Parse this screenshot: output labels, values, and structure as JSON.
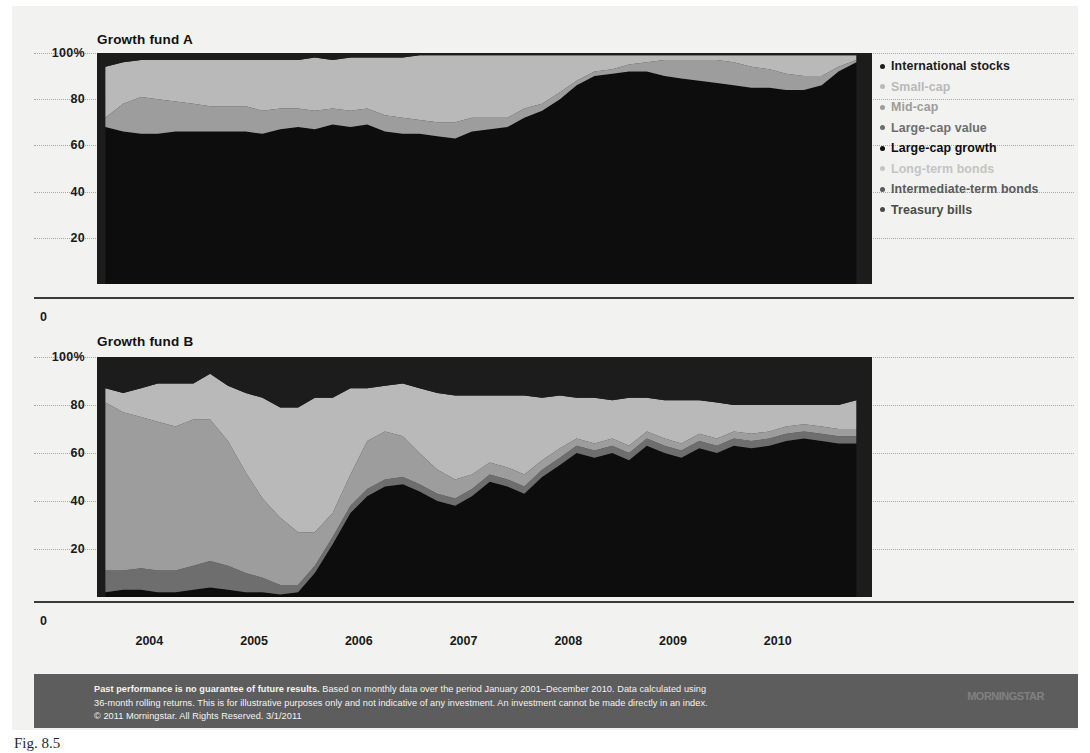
{
  "figure": {
    "caption": "Fig. 8.5",
    "background": "#f2f2f0"
  },
  "panels": [
    {
      "id": "A",
      "title": "Growth fund A"
    },
    {
      "id": "B",
      "title": "Growth fund B"
    }
  ],
  "yaxis": {
    "ticks": [
      "100%",
      "80",
      "60",
      "40",
      "20"
    ],
    "zero_label": "0",
    "values": [
      100,
      80,
      60,
      40,
      20,
      0
    ],
    "min": 0,
    "max": 100
  },
  "xaxis": {
    "ticks": [
      "2004",
      "2005",
      "2006",
      "2007",
      "2008",
      "2009",
      "2010"
    ],
    "values": [
      2004,
      2005,
      2006,
      2007,
      2008,
      2009,
      2010
    ]
  },
  "legend": {
    "position": "right",
    "items": [
      {
        "label": "International stocks",
        "color": "#1c1c1c"
      },
      {
        "label": "Small-cap",
        "color": "#b9b9b9"
      },
      {
        "label": "Mid-cap",
        "color": "#9d9d9d"
      },
      {
        "label": "Large-cap value",
        "color": "#6e6e6e"
      },
      {
        "label": "Large-cap growth",
        "color": "#0d0d0d"
      },
      {
        "label": "Long-term bonds",
        "color": "#c4c4c4"
      },
      {
        "label": "Intermediate-term bonds",
        "color": "#5a5a5a"
      },
      {
        "label": "Treasury bills",
        "color": "#4a4a4a"
      }
    ]
  },
  "footer": {
    "lead": "Past performance is no guarantee of future results.",
    "line1_rest": " Based on monthly data over the period January 2001–December 2010. Data calculated using",
    "line2": "36-month rolling returns. This is for illustrative purposes only and not indicative of any investment. An investment cannot be made directly in an index.",
    "line3": "© 2011 Morningstar. All Rights Reserved. 3/1/2011",
    "brand": "MORNINGSTAR",
    "background": "#5d5d5d",
    "text_color": "#f4f4f4"
  },
  "chart_data": {
    "type": "area",
    "xlabel": "",
    "ylabel": "",
    "ylim": [
      0,
      100
    ],
    "xlim": [
      2003.5,
      2010.9
    ],
    "grid": true,
    "stacked": true,
    "legend_position": "right",
    "charts": [
      {
        "name": "Growth fund A",
        "x": [
          2003.58,
          2003.75,
          2003.92,
          2004.08,
          2004.25,
          2004.42,
          2004.58,
          2004.75,
          2004.92,
          2005.08,
          2005.25,
          2005.42,
          2005.58,
          2005.75,
          2005.92,
          2006.08,
          2006.25,
          2006.42,
          2006.58,
          2006.75,
          2006.92,
          2007.08,
          2007.25,
          2007.42,
          2007.58,
          2007.75,
          2007.92,
          2008.08,
          2008.25,
          2008.42,
          2008.58,
          2008.75,
          2008.92,
          2009.08,
          2009.25,
          2009.42,
          2009.58,
          2009.75,
          2009.92,
          2010.08,
          2010.25,
          2010.42,
          2010.58,
          2010.75
        ],
        "series": [
          {
            "name": "Large-cap growth",
            "color": "#0d0d0d",
            "values": [
              68,
              66,
              65,
              65,
              66,
              66,
              66,
              66,
              66,
              65,
              67,
              68,
              67,
              69,
              68,
              69,
              66,
              65,
              65,
              64,
              63,
              66,
              67,
              68,
              72,
              75,
              80,
              86,
              90,
              91,
              92,
              92,
              90,
              89,
              88,
              87,
              86,
              85,
              85,
              84,
              84,
              86,
              92,
              96
            ]
          },
          {
            "name": "Mid-cap",
            "color": "#9d9d9d",
            "values": [
              4,
              12,
              16,
              15,
              13,
              12,
              11,
              11,
              11,
              10,
              9,
              8,
              8,
              7,
              7,
              7,
              7,
              7,
              6,
              6,
              7,
              6,
              5,
              4,
              4,
              3,
              3,
              2,
              2,
              2,
              3,
              4,
              7,
              8,
              9,
              10,
              10,
              9,
              8,
              7,
              6,
              4,
              2,
              1
            ]
          },
          {
            "name": "Small-cap",
            "color": "#b9b9b9",
            "values": [
              22,
              18,
              16,
              17,
              18,
              19,
              20,
              20,
              20,
              22,
              21,
              21,
              23,
              21,
              23,
              22,
              25,
              26,
              28,
              29,
              29,
              27,
              27,
              27,
              23,
              21,
              16,
              11,
              7,
              6,
              4,
              3,
              2,
              2,
              2,
              2,
              3,
              5,
              6,
              8,
              9,
              9,
              5,
              2
            ]
          },
          {
            "name": "International stocks",
            "color": "#1c1c1c",
            "values": [
              6,
              4,
              3,
              3,
              3,
              3,
              3,
              3,
              3,
              3,
              3,
              3,
              2,
              3,
              2,
              2,
              2,
              2,
              1,
              1,
              1,
              1,
              1,
              1,
              1,
              1,
              1,
              1,
              1,
              1,
              1,
              1,
              1,
              1,
              1,
              1,
              1,
              1,
              1,
              1,
              1,
              1,
              1,
              1
            ]
          }
        ]
      },
      {
        "name": "Growth fund B",
        "x": [
          2003.58,
          2003.75,
          2003.92,
          2004.08,
          2004.25,
          2004.42,
          2004.58,
          2004.75,
          2004.92,
          2005.08,
          2005.25,
          2005.42,
          2005.58,
          2005.75,
          2005.92,
          2006.08,
          2006.25,
          2006.42,
          2006.58,
          2006.75,
          2006.92,
          2007.08,
          2007.25,
          2007.42,
          2007.58,
          2007.75,
          2007.92,
          2008.08,
          2008.25,
          2008.42,
          2008.58,
          2008.75,
          2008.92,
          2009.08,
          2009.25,
          2009.42,
          2009.58,
          2009.75,
          2009.92,
          2010.08,
          2010.25,
          2010.42,
          2010.58,
          2010.75
        ],
        "series": [
          {
            "name": "Large-cap growth",
            "color": "#0d0d0d",
            "values": [
              2,
              3,
              3,
              2,
              2,
              3,
              4,
              3,
              2,
              2,
              1,
              2,
              10,
              22,
              35,
              42,
              46,
              47,
              44,
              40,
              38,
              42,
              48,
              46,
              43,
              50,
              55,
              60,
              58,
              60,
              57,
              63,
              60,
              58,
              62,
              60,
              63,
              62,
              63,
              65,
              66,
              65,
              64,
              64
            ]
          },
          {
            "name": "Large-cap value",
            "color": "#6e6e6e",
            "values": [
              9,
              8,
              9,
              9,
              9,
              10,
              11,
              10,
              8,
              6,
              4,
              3,
              3,
              3,
              3,
              3,
              3,
              3,
              3,
              3,
              3,
              3,
              3,
              3,
              3,
              3,
              3,
              3,
              3,
              3,
              3,
              3,
              3,
              3,
              3,
              3,
              3,
              3,
              3,
              3,
              3,
              3,
              3,
              3
            ]
          },
          {
            "name": "Mid-cap",
            "color": "#9d9d9d",
            "values": [
              70,
              66,
              63,
              62,
              60,
              61,
              59,
              52,
              42,
              33,
              28,
              22,
              14,
              10,
              13,
              20,
              20,
              17,
              13,
              10,
              8,
              6,
              5,
              5,
              5,
              4,
              4,
              3,
              3,
              3,
              3,
              3,
              3,
              3,
              3,
              3,
              3,
              3,
              3,
              3,
              3,
              3,
              3,
              3
            ]
          },
          {
            "name": "Small-cap",
            "color": "#b9b9b9",
            "values": [
              6,
              8,
              12,
              16,
              18,
              15,
              19,
              23,
              33,
              42,
              46,
              52,
              56,
              48,
              36,
              22,
              19,
              22,
              27,
              32,
              35,
              33,
              28,
              30,
              33,
              26,
              22,
              17,
              19,
              16,
              20,
              14,
              16,
              18,
              14,
              15,
              11,
              12,
              11,
              9,
              8,
              9,
              10,
              12
            ]
          },
          {
            "name": "International stocks",
            "color": "#1c1c1c",
            "values": [
              13,
              15,
              13,
              11,
              11,
              11,
              7,
              12,
              15,
              17,
              21,
              21,
              17,
              17,
              13,
              13,
              12,
              11,
              13,
              15,
              16,
              16,
              16,
              16,
              16,
              17,
              16,
              17,
              17,
              18,
              17,
              17,
              18,
              18,
              18,
              19,
              20,
              20,
              20,
              20,
              20,
              20,
              20,
              18
            ]
          }
        ]
      }
    ]
  }
}
